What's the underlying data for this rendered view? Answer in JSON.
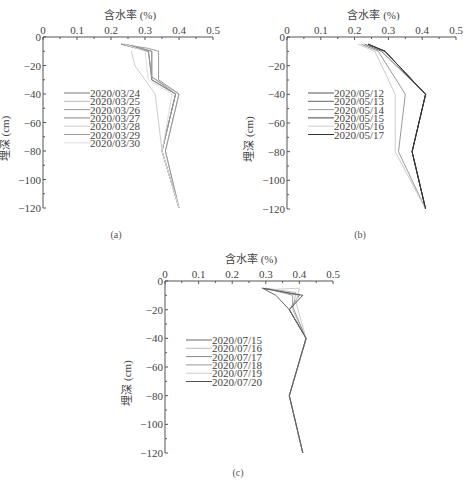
{
  "chart_data": [
    {
      "id": "a",
      "type": "line",
      "caption": "(a)",
      "title": "",
      "xlabel": "含水率 (%)",
      "ylabel": "埋深 (cm)",
      "x_ticks": [
        "0",
        "0.1",
        "0.2",
        "0.3",
        "0.4",
        "0.5"
      ],
      "y_ticks": [
        "0",
        "-20",
        "-40",
        "-60",
        "-80",
        "-100",
        "-120"
      ],
      "xlim": [
        0,
        0.5
      ],
      "ylim": [
        -120,
        0
      ],
      "grid": false,
      "legend_position": "left-middle",
      "series": [
        {
          "name": "2020/03/24",
          "color": "#777777",
          "points": [
            [
              0.23,
              -5
            ],
            [
              0.31,
              -10
            ],
            [
              0.32,
              -30
            ],
            [
              0.39,
              -40
            ],
            [
              0.35,
              -80
            ],
            [
              0.4,
              -120
            ]
          ]
        },
        {
          "name": "2020/03/25",
          "color": "#bbbbbb",
          "points": [
            [
              0.24,
              -5
            ],
            [
              0.32,
              -10
            ],
            [
              0.32,
              -28
            ],
            [
              0.4,
              -40
            ],
            [
              0.36,
              -80
            ],
            [
              0.4,
              -120
            ]
          ]
        },
        {
          "name": "2020/03/26",
          "color": "#999999",
          "points": [
            [
              0.23,
              -5
            ],
            [
              0.31,
              -8
            ],
            [
              0.34,
              -10
            ],
            [
              0.34,
              -30
            ],
            [
              0.4,
              -40
            ],
            [
              0.36,
              -80
            ],
            [
              0.4,
              -120
            ]
          ]
        },
        {
          "name": "2020/03/27",
          "color": "#888888",
          "points": [
            [
              0.24,
              -5
            ],
            [
              0.32,
              -10
            ],
            [
              0.32,
              -30
            ],
            [
              0.39,
              -40
            ],
            [
              0.35,
              -80
            ],
            [
              0.4,
              -120
            ]
          ]
        },
        {
          "name": "2020/03/28",
          "color": "#cccccc",
          "points": [
            [
              0.26,
              -10
            ],
            [
              0.27,
              -20
            ],
            [
              0.33,
              -40
            ],
            [
              0.35,
              -80
            ],
            [
              0.4,
              -120
            ]
          ]
        },
        {
          "name": "2020/03/29",
          "color": "#999999",
          "points": [
            [
              0.23,
              -5
            ],
            [
              0.31,
              -10
            ],
            [
              0.32,
              -28
            ],
            [
              0.39,
              -40
            ],
            [
              0.35,
              -80
            ],
            [
              0.4,
              -120
            ]
          ]
        },
        {
          "name": "2020/03/30",
          "color": "#dddddd",
          "points": [
            [
              0.24,
              -5
            ],
            [
              0.3,
              -10
            ],
            [
              0.31,
              -30
            ],
            [
              0.38,
              -40
            ],
            [
              0.35,
              -80
            ],
            [
              0.4,
              -120
            ]
          ]
        }
      ]
    },
    {
      "id": "b",
      "type": "line",
      "caption": "(b)",
      "title": "",
      "xlabel": "含水率 (%)",
      "ylabel": "埋深 (cm)",
      "x_ticks": [
        "0",
        "0.1",
        "0.2",
        "0.3",
        "0.4",
        "0.5"
      ],
      "y_ticks": [
        "0",
        "-20",
        "-40",
        "-60",
        "-80",
        "-100",
        "-120"
      ],
      "xlim": [
        0,
        0.5
      ],
      "ylim": [
        -120,
        0
      ],
      "grid": false,
      "legend_position": "left-middle",
      "series": [
        {
          "name": "2020/05/12",
          "color": "#555555",
          "points": [
            [
              0.24,
              -5
            ],
            [
              0.29,
              -10
            ],
            [
              0.41,
              -40
            ],
            [
              0.37,
              -80
            ],
            [
              0.41,
              -120
            ]
          ]
        },
        {
          "name": "2020/05/13",
          "color": "#666666",
          "points": [
            [
              0.23,
              -5
            ],
            [
              0.28,
              -10
            ],
            [
              0.41,
              -40
            ],
            [
              0.37,
              -80
            ],
            [
              0.41,
              -120
            ]
          ]
        },
        {
          "name": "2020/05/14",
          "color": "#999999",
          "points": [
            [
              0.22,
              -5
            ],
            [
              0.27,
              -10
            ],
            [
              0.35,
              -40
            ],
            [
              0.33,
              -80
            ],
            [
              0.41,
              -120
            ]
          ]
        },
        {
          "name": "2020/05/15",
          "color": "#444444",
          "points": [
            [
              0.24,
              -5
            ],
            [
              0.29,
              -10
            ],
            [
              0.41,
              -40
            ],
            [
              0.37,
              -80
            ],
            [
              0.41,
              -120
            ]
          ]
        },
        {
          "name": "2020/05/16",
          "color": "#cccccc",
          "points": [
            [
              0.21,
              -5
            ],
            [
              0.26,
              -10
            ],
            [
              0.32,
              -40
            ],
            [
              0.32,
              -80
            ],
            [
              0.41,
              -120
            ]
          ]
        },
        {
          "name": "2020/05/17",
          "color": "#333333",
          "points": [
            [
              0.24,
              -5
            ],
            [
              0.29,
              -10
            ],
            [
              0.41,
              -40
            ],
            [
              0.37,
              -80
            ],
            [
              0.41,
              -120
            ]
          ]
        }
      ]
    },
    {
      "id": "c",
      "type": "line",
      "caption": "(c)",
      "title": "",
      "xlabel": "含水率 (%)",
      "ylabel": "埋深 (cm)",
      "x_ticks": [
        "0",
        "0.1",
        "0.2",
        "0.3",
        "0.4",
        "0.5"
      ],
      "y_ticks": [
        "0",
        "-20",
        "-40",
        "-60",
        "-80",
        "-100",
        "-120"
      ],
      "xlim": [
        0,
        0.5
      ],
      "ylim": [
        -120,
        0
      ],
      "grid": false,
      "legend_position": "left-middle",
      "series": [
        {
          "name": "2020/07/15",
          "color": "#666666",
          "points": [
            [
              0.29,
              -5
            ],
            [
              0.33,
              -10
            ],
            [
              0.37,
              -20
            ],
            [
              0.42,
              -40
            ],
            [
              0.37,
              -80
            ],
            [
              0.41,
              -120
            ]
          ]
        },
        {
          "name": "2020/07/16",
          "color": "#bbbbbb",
          "points": [
            [
              0.3,
              -5
            ],
            [
              0.39,
              -8
            ],
            [
              0.38,
              -20
            ],
            [
              0.42,
              -40
            ],
            [
              0.37,
              -80
            ],
            [
              0.41,
              -120
            ]
          ]
        },
        {
          "name": "2020/07/17",
          "color": "#888888",
          "points": [
            [
              0.29,
              -5
            ],
            [
              0.4,
              -10
            ],
            [
              0.37,
              -20
            ],
            [
              0.42,
              -40
            ],
            [
              0.37,
              -80
            ],
            [
              0.41,
              -120
            ]
          ]
        },
        {
          "name": "2020/07/18",
          "color": "#999999",
          "points": [
            [
              0.3,
              -5
            ],
            [
              0.38,
              -10
            ],
            [
              0.38,
              -18
            ],
            [
              0.42,
              -40
            ],
            [
              0.37,
              -80
            ],
            [
              0.41,
              -120
            ]
          ]
        },
        {
          "name": "2020/07/19",
          "color": "#cccccc",
          "points": [
            [
              0.31,
              -6
            ],
            [
              0.4,
              -5
            ],
            [
              0.39,
              -15
            ],
            [
              0.42,
              -40
            ],
            [
              0.37,
              -80
            ],
            [
              0.41,
              -120
            ]
          ]
        },
        {
          "name": "2020/07/20",
          "color": "#555555",
          "points": [
            [
              0.29,
              -5
            ],
            [
              0.41,
              -10
            ],
            [
              0.37,
              -20
            ],
            [
              0.42,
              -40
            ],
            [
              0.37,
              -80
            ],
            [
              0.41,
              -120
            ]
          ]
        }
      ]
    }
  ]
}
